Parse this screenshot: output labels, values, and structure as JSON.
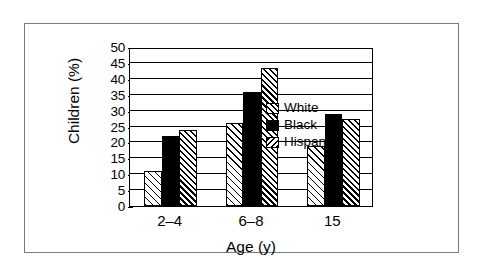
{
  "chart_data": {
    "type": "bar",
    "title": "",
    "subtitle": "",
    "xlabel": "Age (y)",
    "ylabel": "Children (%)",
    "categories": [
      "2–4",
      "6–8",
      "15"
    ],
    "series": [
      {
        "name": "White",
        "values": [
          11,
          26,
          19
        ],
        "fill": "hatch-light",
        "legend_swatch": "hatch-fwd"
      },
      {
        "name": "Black",
        "values": [
          22,
          36,
          29
        ],
        "fill": "solid-black",
        "legend_swatch": "solid-black"
      },
      {
        "name": "Hispanic",
        "values": [
          24,
          43.5,
          27.3
        ],
        "fill": "hatch-dense",
        "legend_swatch": "hatch-back"
      }
    ],
    "ylim": [
      0,
      50
    ],
    "ytick_step": 5,
    "yticks": [
      0,
      5,
      10,
      15,
      20,
      25,
      30,
      35,
      40,
      45,
      50
    ],
    "ytick_labels": [
      "0",
      "5",
      "10",
      "15",
      "20",
      "25",
      "30",
      "35",
      "40",
      "45",
      "50"
    ],
    "grid": true,
    "grid_axis": "y",
    "legend_position": "top-left-inside",
    "legend_entries": [
      "White",
      "Black",
      "Hispanic"
    ],
    "colors": {
      "axis": "#000000",
      "grid": "#000000",
      "black_series": "#000000",
      "background": "#ffffff",
      "frame": "#7a7a7a"
    }
  }
}
